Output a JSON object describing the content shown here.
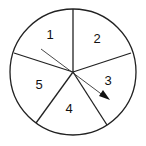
{
  "diagram": {
    "type": "spinner",
    "sections": [
      {
        "label": "1",
        "x": 50,
        "y": 38
      },
      {
        "label": "2",
        "x": 97,
        "y": 43
      },
      {
        "label": "3",
        "x": 108,
        "y": 85
      },
      {
        "label": "4",
        "x": 69,
        "y": 112
      },
      {
        "label": "5",
        "x": 39,
        "y": 89
      }
    ],
    "pointer": "arrow"
  }
}
